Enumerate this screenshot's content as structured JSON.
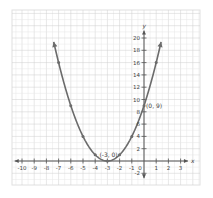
{
  "chart_data": {
    "type": "line",
    "title": "",
    "equation_implied": "y = (x + 3)^2",
    "xlabel": "x",
    "ylabel": "y",
    "xlim": [
      -10,
      3
    ],
    "ylim": [
      -2,
      20
    ],
    "grid": true,
    "legend": null,
    "x_ticks": [
      -10,
      -9,
      -8,
      -7,
      -6,
      -5,
      -4,
      -3,
      -2,
      -1,
      0,
      1,
      2,
      3
    ],
    "x_tick_labels": [
      "-10",
      "-9",
      "-8",
      "-7",
      "-6",
      "-5",
      "-4",
      "-3",
      "-2",
      "-1",
      "0",
      "1",
      "2",
      "3"
    ],
    "y_ticks": [
      -2,
      2,
      4,
      6,
      8,
      10,
      12,
      14,
      16,
      18,
      20
    ],
    "y_tick_labels": [
      "-2",
      "2",
      "4",
      "6",
      "8",
      "10",
      "12",
      "14",
      "16",
      "18",
      "20"
    ],
    "series": [
      {
        "name": "parabola",
        "points": [
          {
            "x": -7,
            "y": 16
          },
          {
            "x": -6,
            "y": 9
          },
          {
            "x": -5,
            "y": 4
          },
          {
            "x": -4,
            "y": 1
          },
          {
            "x": -3,
            "y": 0
          },
          {
            "x": -2,
            "y": 1
          },
          {
            "x": -1,
            "y": 4
          },
          {
            "x": 0,
            "y": 9
          },
          {
            "x": 1,
            "y": 16
          }
        ],
        "x_range": [
          -7.4,
          1.4
        ],
        "arrows_at_ends": true
      }
    ],
    "annotations": [
      {
        "text": "(-3, 0)",
        "x": -3,
        "y": 0
      },
      {
        "text": "(0, 9)",
        "x": 0,
        "y": 9
      }
    ]
  },
  "colors": {
    "background": "#ffffff",
    "grid_minor": "#e6e6e6",
    "grid_major": "#cfcfcf",
    "axis": "#555555",
    "curve": "#6b6b6b",
    "text": "#444444",
    "panel_border": "#e0e0e0"
  },
  "axis_labels": {
    "x": "x",
    "y": "y"
  },
  "annotation_labels": {
    "vertex": "(-3, 0)",
    "y_intercept": "(0, 9)"
  }
}
